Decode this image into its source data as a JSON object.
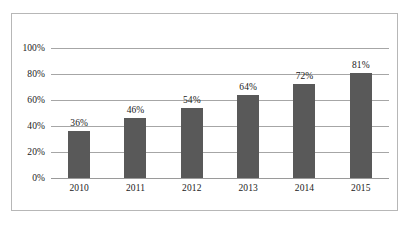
{
  "chart_data": {
    "type": "bar",
    "title": "",
    "subtitle": "",
    "xlabel": "",
    "ylabel": "",
    "categories": [
      "2010",
      "2011",
      "2012",
      "2013",
      "2014",
      "2015"
    ],
    "values": [
      36,
      46,
      54,
      64,
      72,
      81
    ],
    "data_labels": [
      "36%",
      "46%",
      "54%",
      "64%",
      "72%",
      "81%"
    ],
    "ylim": [
      0,
      100
    ],
    "ytick_values": [
      0,
      20,
      40,
      60,
      80,
      100
    ],
    "ytick_labels": [
      "0%",
      "20%",
      "40%",
      "60%",
      "80%",
      "100%"
    ],
    "grid": true,
    "legend": false,
    "legend_position": "none",
    "series": [
      {
        "name": "",
        "values": [
          36,
          46,
          54,
          64,
          72,
          81
        ]
      }
    ],
    "colors": {
      "bar": "#595959",
      "gridline": "#a6a6a6",
      "border": "#b7b7b7",
      "text": "#1a1a1a",
      "background": "#ffffff"
    }
  }
}
